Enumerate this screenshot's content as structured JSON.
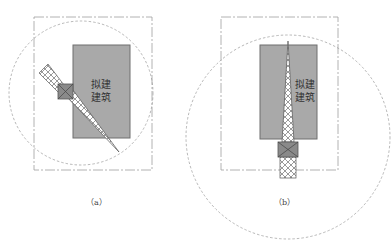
{
  "panels": [
    {
      "id": "a",
      "caption": "（a）",
      "building_label_line1": "拟建",
      "building_label_line2": "建筑",
      "crane_orientation": "diagonal"
    },
    {
      "id": "b",
      "caption": "（b）",
      "building_label_line1": "拟建",
      "building_label_line2": "建筑",
      "crane_orientation": "vertical"
    }
  ],
  "colors": {
    "building_fill": "#a9a9a9",
    "building_stroke": "#6f6f6f",
    "base_fill": "#8a8a8a",
    "line": "#555555",
    "dashed": "#9a9a9a"
  }
}
